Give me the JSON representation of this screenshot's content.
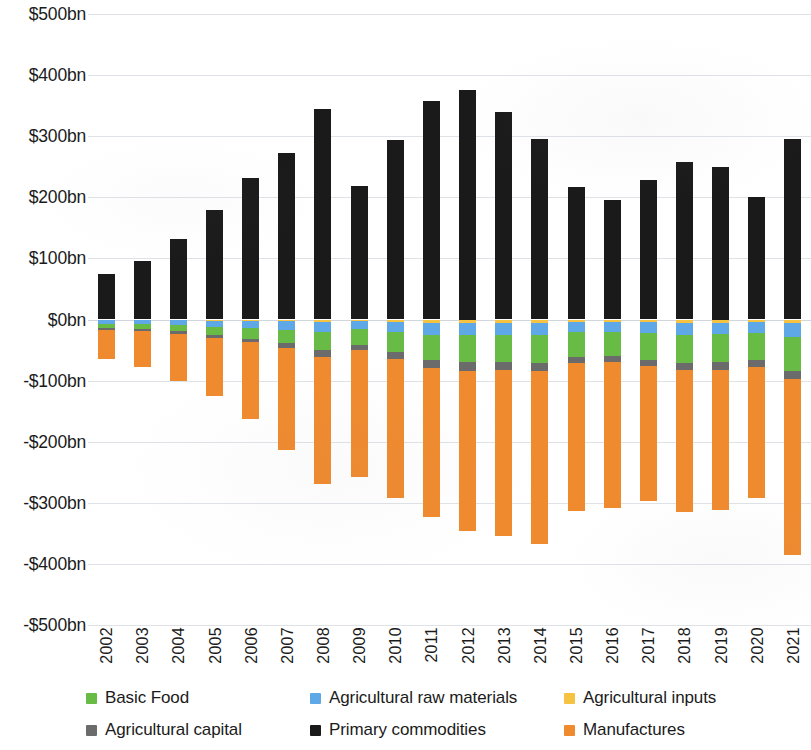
{
  "chart_data": {
    "type": "bar",
    "subtype": "stacked-bar-diverging",
    "title": "",
    "xlabel": "",
    "ylabel": "",
    "ylim": [
      -500,
      500
    ],
    "ytick_step": 100,
    "yunit": "bn",
    "ycurrency": "$",
    "grid": true,
    "legend_position": "bottom",
    "categories": [
      "2002",
      "2003",
      "2004",
      "2005",
      "2006",
      "2007",
      "2008",
      "2009",
      "2010",
      "2011",
      "2012",
      "2013",
      "2014",
      "2015",
      "2016",
      "2017",
      "2018",
      "2019",
      "2020",
      "2021"
    ],
    "ytick_labels": [
      "$500bn",
      "$400bn",
      "$300bn",
      "$200bn",
      "$100bn",
      "$0bn",
      "-$100bn",
      "-$200bn",
      "-$300bn",
      "-$400bn",
      "-$500bn"
    ],
    "ytick_values": [
      500,
      400,
      300,
      200,
      100,
      0,
      -100,
      -200,
      -300,
      -400,
      -500
    ],
    "series": [
      {
        "name": "Primary commodities",
        "color": "#1a1a1a",
        "values": [
          75,
          95,
          131,
          180,
          232,
          272,
          345,
          219,
          294,
          357,
          375,
          339,
          295,
          217,
          195,
          228,
          258,
          250,
          201,
          295
        ]
      },
      {
        "name": "Agricultural inputs",
        "color": "#f5c242",
        "values": [
          -1,
          -1,
          -1.5,
          -2,
          -2.5,
          -3,
          -4,
          -3,
          -4,
          -5,
          -5,
          -5,
          -5,
          -4,
          -4,
          -4.5,
          -5,
          -5,
          -4.5,
          -6
        ]
      },
      {
        "name": "Agricultural raw materials",
        "color": "#5fa8e8",
        "values": [
          -6,
          -7,
          -8,
          -10,
          -12,
          -14,
          -16,
          -13,
          -17,
          -20,
          -21,
          -20,
          -20,
          -17,
          -16,
          -18,
          -20,
          -19,
          -17,
          -22
        ]
      },
      {
        "name": "Basic Food",
        "color": "#68bb45",
        "values": [
          -7,
          -8,
          -10,
          -13,
          -17,
          -22,
          -30,
          -26,
          -33,
          -41,
          -44,
          -45,
          -46,
          -41,
          -40,
          -43,
          -46,
          -46,
          -45,
          -56
        ]
      },
      {
        "name": "Agricultural capital",
        "color": "#6b6b6b",
        "values": [
          -3,
          -3,
          -4,
          -5,
          -6,
          -8,
          -11,
          -8,
          -11,
          -13,
          -14,
          -13,
          -13,
          -10,
          -9,
          -11,
          -12,
          -12,
          -11,
          -14
        ]
      },
      {
        "name": "Manufactures",
        "color": "#f08a2e",
        "values": [
          -47,
          -59,
          -77,
          -96,
          -125,
          -166,
          -209,
          -208,
          -227,
          -245,
          -262,
          -271,
          -283,
          -242,
          -240,
          -220,
          -232,
          -230,
          -214,
          -288
        ]
      }
    ],
    "stack_order_negative": [
      "Agricultural inputs",
      "Agricultural raw materials",
      "Basic Food",
      "Agricultural capital",
      "Manufactures"
    ],
    "legend": [
      {
        "label": "Basic Food",
        "color": "#68bb45"
      },
      {
        "label": "Agricultural raw materials",
        "color": "#5fa8e8"
      },
      {
        "label": "Agricultural inputs",
        "color": "#f5c242"
      },
      {
        "label": "Agricultural capital",
        "color": "#6b6b6b"
      },
      {
        "label": "Primary commodities",
        "color": "#1a1a1a"
      },
      {
        "label": "Manufactures",
        "color": "#f08a2e"
      }
    ]
  }
}
